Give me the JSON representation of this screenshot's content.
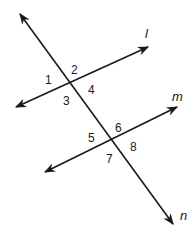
{
  "diagram": {
    "lines": [
      {
        "name": "l",
        "label": "l",
        "x1": 16,
        "y1": 107,
        "x2": 148,
        "y2": 47,
        "label_x": 145,
        "label_y": 38
      },
      {
        "name": "m",
        "label": "m",
        "x1": 45,
        "y1": 172,
        "x2": 177,
        "y2": 107,
        "label_x": 172,
        "label_y": 101
      },
      {
        "name": "n",
        "label": "n",
        "x1": 20,
        "y1": 14,
        "x2": 173,
        "y2": 224,
        "label_x": 180,
        "label_y": 220
      }
    ],
    "intersections": [
      {
        "lines": [
          "l",
          "n"
        ],
        "x": 70,
        "y": 83
      },
      {
        "lines": [
          "m",
          "n"
        ],
        "x": 114,
        "y": 139
      }
    ],
    "angles": [
      {
        "label": "1",
        "x": 45,
        "y": 84
      },
      {
        "label": "2",
        "x": 71,
        "y": 74
      },
      {
        "label": "3",
        "x": 63,
        "y": 105
      },
      {
        "label": "4",
        "x": 88,
        "y": 94
      },
      {
        "label": "5",
        "x": 88,
        "y": 142
      },
      {
        "label": "6",
        "x": 115,
        "y": 132
      },
      {
        "label": "7",
        "x": 106,
        "y": 163
      },
      {
        "label": "8",
        "x": 130,
        "y": 151
      }
    ],
    "stroke_color": "#1a1a1a",
    "background": "#ffffff"
  }
}
